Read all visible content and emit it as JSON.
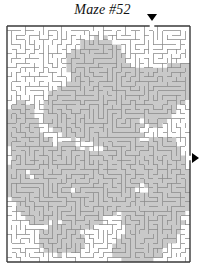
{
  "page": {
    "width": 205,
    "height": 274,
    "background_color": "#ffffff"
  },
  "title": {
    "text": "Maze #52",
    "color": "#111111",
    "style": "italic-serif"
  },
  "maze": {
    "label": "maze-grid",
    "cols": 40,
    "rows": 51,
    "x": 7,
    "y": 26,
    "width": 183,
    "height": 236,
    "cell_size": 4.575,
    "wall_color": "#8a8a8a",
    "border_color": "#3a3a3a",
    "passage_color": "#ffffff",
    "shade_color": "#c9c9c9",
    "wall_width": 0.75,
    "border_width": 1.4,
    "seed": 5287,
    "shade_blobs": [
      {
        "cx": 0.5,
        "cy": 0.17,
        "rx": 0.17,
        "ry": 0.12
      },
      {
        "cx": 0.63,
        "cy": 0.26,
        "rx": 0.16,
        "ry": 0.11
      },
      {
        "cx": 0.8,
        "cy": 0.3,
        "rx": 0.13,
        "ry": 0.13
      },
      {
        "cx": 0.93,
        "cy": 0.24,
        "rx": 0.1,
        "ry": 0.09
      },
      {
        "cx": 0.39,
        "cy": 0.36,
        "rx": 0.2,
        "ry": 0.12
      },
      {
        "cx": 0.57,
        "cy": 0.42,
        "rx": 0.18,
        "ry": 0.11
      },
      {
        "cx": 0.07,
        "cy": 0.42,
        "rx": 0.1,
        "ry": 0.1
      },
      {
        "cx": 0.14,
        "cy": 0.53,
        "rx": 0.12,
        "ry": 0.09
      },
      {
        "cx": 0.3,
        "cy": 0.6,
        "rx": 0.17,
        "ry": 0.11
      },
      {
        "cx": 0.47,
        "cy": 0.62,
        "rx": 0.15,
        "ry": 0.1
      },
      {
        "cx": 0.66,
        "cy": 0.58,
        "rx": 0.16,
        "ry": 0.12
      },
      {
        "cx": 0.85,
        "cy": 0.6,
        "rx": 0.13,
        "ry": 0.14
      },
      {
        "cx": 0.2,
        "cy": 0.74,
        "rx": 0.16,
        "ry": 0.1
      },
      {
        "cx": 0.4,
        "cy": 0.78,
        "rx": 0.14,
        "ry": 0.09
      },
      {
        "cx": 0.58,
        "cy": 0.72,
        "rx": 0.12,
        "ry": 0.08
      },
      {
        "cx": 0.8,
        "cy": 0.82,
        "rx": 0.17,
        "ry": 0.12
      },
      {
        "cx": 0.95,
        "cy": 0.7,
        "rx": 0.09,
        "ry": 0.1
      },
      {
        "cx": 0.3,
        "cy": 0.9,
        "rx": 0.13,
        "ry": 0.07
      },
      {
        "cx": 0.72,
        "cy": 0.94,
        "rx": 0.15,
        "ry": 0.07
      },
      {
        "cx": 0.05,
        "cy": 0.66,
        "rx": 0.08,
        "ry": 0.08
      }
    ]
  },
  "entrance": {
    "label": "entrance-gap",
    "side": "top",
    "x": 152,
    "col": 31,
    "marker_x": 147,
    "marker_y": 14,
    "marker_color": "#000000"
  },
  "exit": {
    "label": "exit-gap",
    "side": "right",
    "y": 158,
    "row": 29,
    "marker_x": 192,
    "marker_y": 153,
    "marker_color": "#000000"
  }
}
